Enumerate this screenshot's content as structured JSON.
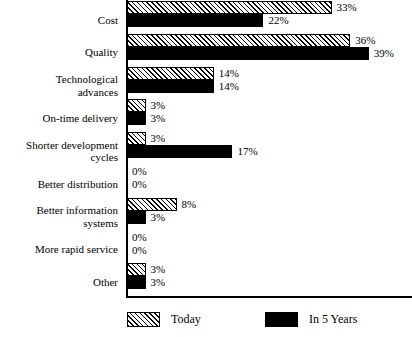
{
  "chart_data": {
    "type": "bar",
    "orientation": "horizontal",
    "title": "",
    "subtitle": "",
    "xlabel": "",
    "ylabel": "",
    "xlim": [
      0,
      40
    ],
    "grid": false,
    "legend_position": "bottom",
    "value_suffix": "%",
    "categories": [
      "Cost",
      "Quality",
      "Technological\nadvances",
      "On-time delivery",
      "Shorter development\ncycles",
      "Better distribution",
      "Better information\nsystems",
      "More rapid service",
      "Other"
    ],
    "series": [
      {
        "name": "Today",
        "pattern": "diagonal-hatch",
        "values": [
          33,
          36,
          14,
          3,
          3,
          0,
          8,
          0,
          3
        ],
        "labels": [
          "33%",
          "36%",
          "14%",
          "3%",
          "3%",
          "0%",
          "8%",
          "0%",
          "3%"
        ]
      },
      {
        "name": "In 5 Years",
        "pattern": "solid-black",
        "values": [
          22,
          39,
          14,
          3,
          17,
          0,
          3,
          0,
          3
        ],
        "labels": [
          "22%",
          "39%",
          "14%",
          "3%",
          "17%",
          "0%",
          "3%",
          "0%",
          "3%"
        ]
      }
    ]
  },
  "legend": {
    "items": [
      {
        "label": "Today"
      },
      {
        "label": "In 5 Years"
      }
    ]
  },
  "colors": {
    "axis": "#000000",
    "bar_future": "#000000",
    "bar_today_fill": "#ffffff",
    "bar_today_hatch": "#000000",
    "background": "#ffffff"
  }
}
